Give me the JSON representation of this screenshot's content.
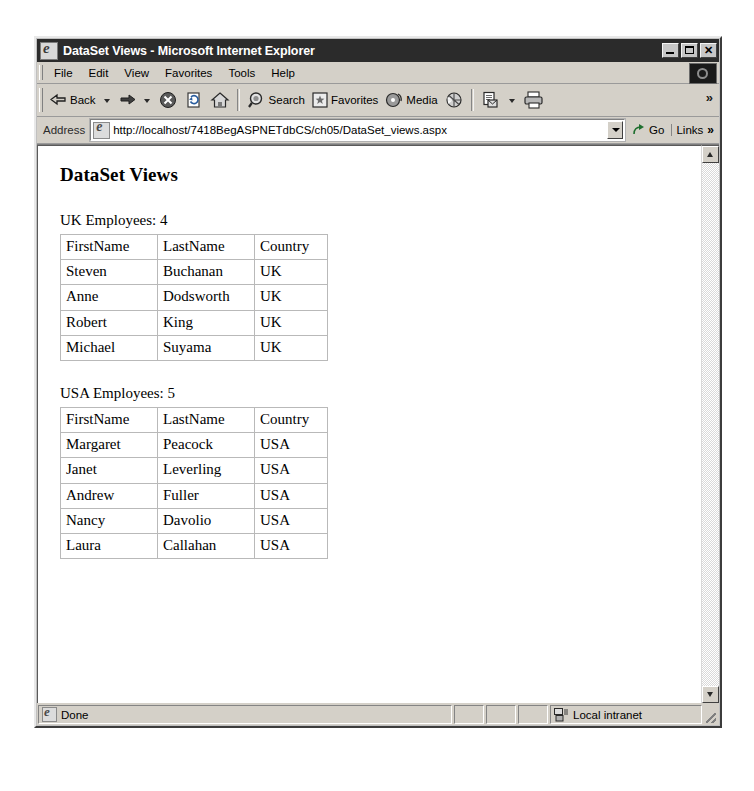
{
  "window": {
    "title": "DataSet Views - Microsoft Internet Explorer",
    "app_icon": "ie-logo-icon",
    "controls": {
      "minimize": "minimize-icon",
      "maximize": "maximize-icon",
      "close": "close-icon"
    }
  },
  "menubar": {
    "items": [
      {
        "label": "File"
      },
      {
        "label": "Edit"
      },
      {
        "label": "View"
      },
      {
        "label": "Favorites"
      },
      {
        "label": "Tools"
      },
      {
        "label": "Help"
      }
    ],
    "brand_icon": "ie-animated-logo-icon"
  },
  "toolbar": {
    "back": {
      "label": "Back",
      "icon": "back-arrow-icon",
      "has_dropdown": true
    },
    "forward": {
      "label": "",
      "icon": "forward-arrow-icon",
      "has_dropdown": true
    },
    "stop": {
      "label": "",
      "icon": "stop-icon"
    },
    "refresh": {
      "label": "",
      "icon": "refresh-icon"
    },
    "home": {
      "label": "",
      "icon": "home-icon"
    },
    "search": {
      "label": "Search",
      "icon": "search-icon"
    },
    "favorites": {
      "label": "Favorites",
      "icon": "favorites-star-icon"
    },
    "media": {
      "label": "Media",
      "icon": "media-icon"
    },
    "history": {
      "label": "",
      "icon": "history-icon"
    },
    "mail": {
      "label": "",
      "icon": "mail-icon",
      "has_dropdown": true
    },
    "print": {
      "label": "",
      "icon": "print-icon"
    },
    "overflow": "»"
  },
  "address": {
    "label": "Address",
    "site_icon": "page-icon",
    "url": "http://localhost/7418BegASPNETdbCS/ch05/DataSet_views.aspx",
    "dropdown_icon": "chevron-down-icon",
    "go": {
      "label": "Go",
      "icon": "go-arrow-icon"
    },
    "links": {
      "label": "Links",
      "chevron": "»"
    }
  },
  "page": {
    "heading": "DataSet Views",
    "sections": [
      {
        "label": "UK Employees: 4",
        "columns": [
          "FirstName",
          "LastName",
          "Country"
        ],
        "rows": [
          [
            "Steven",
            "Buchanan",
            "UK"
          ],
          [
            "Anne",
            "Dodsworth",
            "UK"
          ],
          [
            "Robert",
            "King",
            "UK"
          ],
          [
            "Michael",
            "Suyama",
            "UK"
          ]
        ]
      },
      {
        "label": "USA Employees: 5",
        "columns": [
          "FirstName",
          "LastName",
          "Country"
        ],
        "rows": [
          [
            "Margaret",
            "Peacock",
            "USA"
          ],
          [
            "Janet",
            "Leverling",
            "USA"
          ],
          [
            "Andrew",
            "Fuller",
            "USA"
          ],
          [
            "Nancy",
            "Davolio",
            "USA"
          ],
          [
            "Laura",
            "Callahan",
            "USA"
          ]
        ]
      }
    ]
  },
  "scrollbar": {
    "up_icon": "scroll-up-arrow-icon",
    "down_icon": "scroll-down-arrow-icon"
  },
  "statusbar": {
    "status": "Done",
    "status_icon": "ie-logo-icon",
    "zone": "Local intranet",
    "zone_icon": "network-zone-icon"
  },
  "colors": {
    "titlebar_bg": "#2b2b2b",
    "chrome_bg": "#d4d0c8",
    "page_bg": "#ffffff",
    "table_border": "#b9b9b9",
    "desktop_bg": "#ffffff"
  }
}
